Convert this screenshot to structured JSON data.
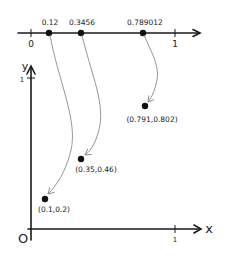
{
  "number_line": {
    "zero_label": "0",
    "one_label": "1",
    "points": [
      {
        "label": "0.12"
      },
      {
        "label": "0.3456"
      },
      {
        "label": "0.789012"
      }
    ]
  },
  "plane": {
    "x_axis_label": "x",
    "y_axis_label": "y",
    "origin_label": "O",
    "x_tick_label": "1",
    "y_tick_label": "1",
    "points": [
      {
        "label": "(0.791,0.802)"
      },
      {
        "label": "(0.35,0.46)"
      },
      {
        "label": "(0.1,0.2)"
      }
    ]
  },
  "colors": {
    "axis": "#1a1a1a",
    "mapping_arrow": "#8a8a8a",
    "dot": "#111111"
  }
}
